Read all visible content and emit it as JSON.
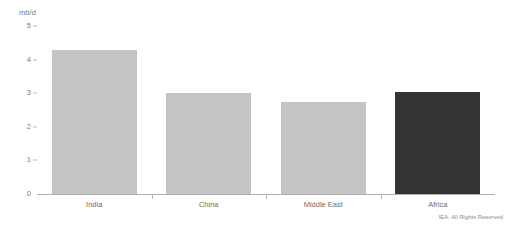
{
  "footer": {
    "copyright": "IEA. All Rights Reserved"
  },
  "chart_data": {
    "type": "bar",
    "title": "",
    "subtitle": "",
    "xlabel": "",
    "ylabel": "mb/d",
    "unit": "mb/d",
    "categories": [
      "India",
      "China",
      "Middle East",
      "Africa"
    ],
    "values": [
      4.3,
      3.0,
      2.75,
      3.05
    ],
    "ylim": [
      0,
      5
    ],
    "yticks": [
      0,
      1,
      2,
      3,
      4,
      5
    ],
    "ytick_labels": [
      "0",
      "1",
      "2",
      "3",
      "4",
      "5"
    ],
    "grid": false,
    "legend": false,
    "legend_position": "none",
    "colors": {
      "bar_default": "#c4c4c4",
      "bar_highlight": "#333333",
      "axis": "#b0b0b0",
      "text": "#6e6e6e",
      "background": "#ffffff"
    },
    "bar_colors": [
      "#c4c4c4",
      "#c4c4c4",
      "#c4c4c4",
      "#333333"
    ],
    "highlighted_category": "Africa",
    "annotations": []
  }
}
